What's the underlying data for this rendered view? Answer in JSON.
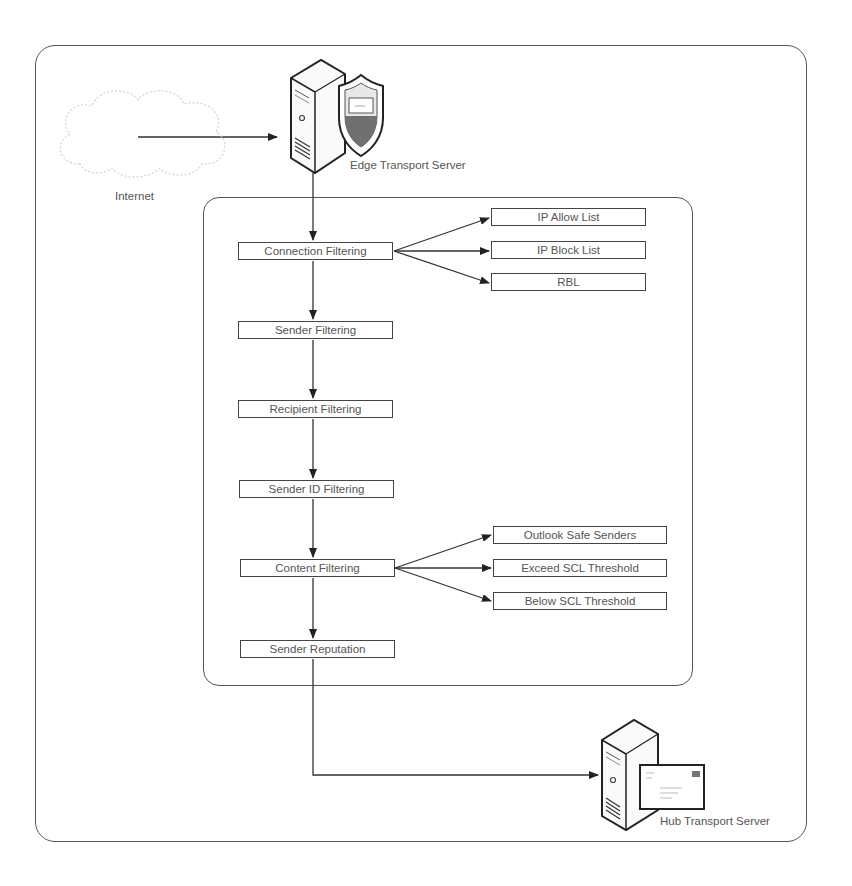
{
  "diagram": {
    "internet_label": "Internet",
    "edge_server_label": "Edge Transport Server",
    "hub_server_label": "Hub Transport Server",
    "pipeline": [
      {
        "label": "Connection Filtering"
      },
      {
        "label": "Sender Filtering"
      },
      {
        "label": "Recipient Filtering"
      },
      {
        "label": "Sender ID Filtering"
      },
      {
        "label": "Content Filtering"
      },
      {
        "label": "Sender Reputation"
      }
    ],
    "connection_outcomes": [
      {
        "label": "IP Allow List"
      },
      {
        "label": "IP Block List"
      },
      {
        "label": "RBL"
      }
    ],
    "content_outcomes": [
      {
        "label": "Outlook Safe Senders"
      },
      {
        "label": "Exceed SCL Threshold"
      },
      {
        "label": "Below SCL Threshold"
      }
    ],
    "colors": {
      "line": "#333333",
      "box_border": "#444444",
      "text": "#555555",
      "shield_dark": "#707070",
      "cloud": "#dcdcdc"
    }
  }
}
